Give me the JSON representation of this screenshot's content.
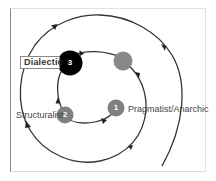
{
  "diagram": {
    "type": "spiral-cycle",
    "nodes": [
      {
        "id": "1",
        "number": "1",
        "label": "Pragmatist/Anarchic",
        "color": "#808080"
      },
      {
        "id": "2",
        "number": "2",
        "label": "Structuralist",
        "color": "#808080"
      },
      {
        "id": "3",
        "number": "3",
        "label": "Dialectic",
        "color": "#000000"
      },
      {
        "id": "4",
        "number": "",
        "label": "",
        "color": "#888888"
      }
    ],
    "edges": [
      {
        "from": "1",
        "to": "2"
      },
      {
        "from": "2",
        "to": "3"
      },
      {
        "from": "3",
        "to": "4"
      },
      {
        "from": "4",
        "to": "spiral-outward"
      }
    ],
    "colors": {
      "path": "#333333",
      "highlight_node": "#000000",
      "node": "#808080"
    }
  }
}
